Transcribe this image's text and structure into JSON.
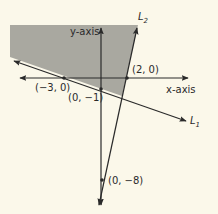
{
  "diagram": {
    "type": "linear-inequality-graph",
    "axes": {
      "x_label": "x-axis",
      "y_label": "y-axis"
    },
    "points": [
      {
        "label": "(−3, 0)",
        "x": -3,
        "y": 0
      },
      {
        "label": "(2, 0)",
        "x": 2,
        "y": 0
      },
      {
        "label": "(0, −1)",
        "x": 0,
        "y": -1
      },
      {
        "label": "(0, −8)",
        "x": 0,
        "y": -8
      }
    ],
    "lines": [
      {
        "name": "L",
        "subscript": "1",
        "through": [
          "(−3, 0)",
          "(0, −1)"
        ]
      },
      {
        "name": "L",
        "subscript": "2",
        "through": [
          "(2, 0)",
          "(0, −8)"
        ]
      }
    ],
    "shaded_region": "above L1 and left of L2",
    "colors": {
      "background": "#fbf8ea",
      "shade": "#a09e98",
      "line": "#2a2a2a"
    }
  }
}
